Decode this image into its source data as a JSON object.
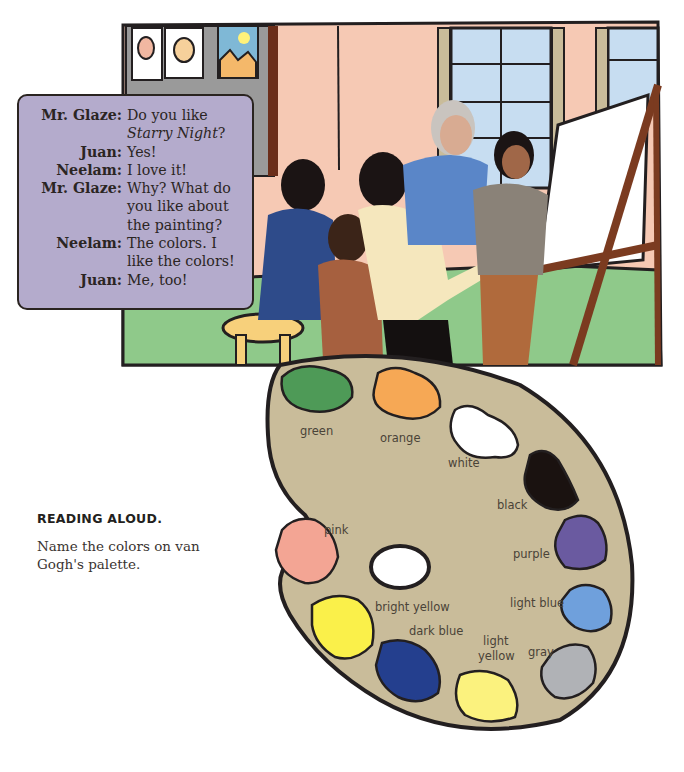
{
  "dialogue": {
    "lines": [
      {
        "speaker": "Mr. Glaze:",
        "text": "Do you like",
        "title_part": "Starry Night",
        "text_after": "?"
      },
      {
        "speaker": "Juan:",
        "text": "Yes!"
      },
      {
        "speaker": "Neelam:",
        "text": "I love it!"
      },
      {
        "speaker": "Mr. Glaze:",
        "text": "Why? What do you like about the painting?"
      },
      {
        "speaker": "Neelam:",
        "text": "The colors. I like the colors!"
      },
      {
        "speaker": "Juan:",
        "text": "Me, too!"
      }
    ]
  },
  "activity": {
    "title": "READING ALOUD.",
    "instruction": "Name the colors on van Gogh's palette."
  },
  "palette": {
    "colors": [
      {
        "label": "green",
        "hex": "#4e9a57"
      },
      {
        "label": "orange",
        "hex": "#f6a855"
      },
      {
        "label": "white",
        "hex": "#ffffff"
      },
      {
        "label": "black",
        "hex": "#1a1210"
      },
      {
        "label": "purple",
        "hex": "#6a5aa0"
      },
      {
        "label": "light blue",
        "hex": "#6fa0dc"
      },
      {
        "label": "gray",
        "hex": "#b0b2b6"
      },
      {
        "label": "light",
        "label2": "yellow",
        "hex": "#fbf27e"
      },
      {
        "label": "dark blue",
        "hex": "#243f8e"
      },
      {
        "label": "bright yellow",
        "hex": "#faf04a"
      },
      {
        "label": "pink",
        "hex": "#f3a594"
      }
    ],
    "board_color": "#c9bc9a"
  },
  "scene": {
    "wall_color": "#f6c9b4",
    "board_color": "#9a9a9a",
    "window_color": "#c7ddf1",
    "floor_color": "#8fc98a",
    "stool_color": "#f7d07b"
  }
}
